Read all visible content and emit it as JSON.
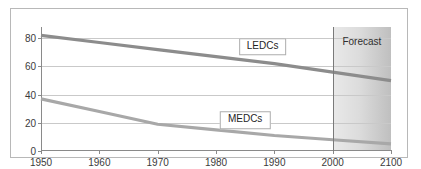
{
  "chart_data": {
    "type": "line",
    "title": "",
    "xlabel": "",
    "ylabel": "",
    "xlim": [
      1950,
      2100
    ],
    "ylim": [
      0,
      88
    ],
    "grid": true,
    "legend_position": "inline-callouts",
    "x_ticks": [
      {
        "label": "1950",
        "value": 1950
      },
      {
        "label": "1960",
        "value": 1960
      },
      {
        "label": "1970",
        "value": 1970
      },
      {
        "label": "1980",
        "value": 1980
      },
      {
        "label": "1990",
        "value": 1990
      },
      {
        "label": "2000",
        "value": 2000
      },
      {
        "label": "2100",
        "value": 2100
      }
    ],
    "y_ticks": [
      {
        "label": "0",
        "value": 0
      },
      {
        "label": "20",
        "value": 20
      },
      {
        "label": "40",
        "value": 40
      },
      {
        "label": "60",
        "value": 60
      },
      {
        "label": "80",
        "value": 80
      }
    ],
    "series": [
      {
        "name": "LEDCs",
        "color": "#8c8c8c",
        "label_x": 1988,
        "label_y": 74,
        "x": [
          1950,
          1960,
          1970,
          1980,
          1990,
          2000,
          2100
        ],
        "values": [
          82,
          77,
          72,
          67,
          62,
          56,
          50
        ]
      },
      {
        "name": "MEDCs",
        "color": "#a8a8a8",
        "label_x": 1985,
        "label_y": 22,
        "x": [
          1950,
          1960,
          1970,
          1980,
          1990,
          2000,
          2100
        ],
        "values": [
          37,
          28,
          19,
          15,
          11,
          8,
          5
        ]
      }
    ],
    "annotations": [
      {
        "name": "forecast",
        "label": "Forecast",
        "start_x": 2000,
        "end_x": 2100,
        "label_x": 2050,
        "label_y": 78,
        "shading": "gray-gradient"
      }
    ],
    "colors": {
      "frame_border": "#b8b8b8",
      "axis": "#8a8a8a",
      "gridline": "#c9c9c9",
      "text": "#3b3b3b",
      "forecast_divider": "#7a7a7a",
      "callout_border": "#adadad",
      "background": "#ffffff"
    }
  }
}
